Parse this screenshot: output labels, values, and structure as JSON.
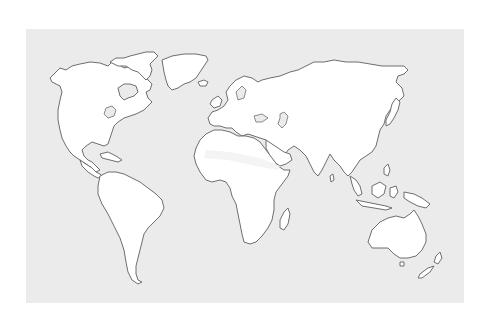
{
  "map": {
    "type": "blank-world-outline",
    "projection": "equirectangular-style",
    "colors": {
      "page_background": "#ffffff",
      "ocean": "#ebebeb",
      "land": "#ffffff",
      "coastline": "#6e6e6e"
    },
    "regions": [
      {
        "name": "North America"
      },
      {
        "name": "Greenland"
      },
      {
        "name": "South America"
      },
      {
        "name": "Europe"
      },
      {
        "name": "Africa"
      },
      {
        "name": "Madagascar"
      },
      {
        "name": "Asia"
      },
      {
        "name": "Japan"
      },
      {
        "name": "Southeast Asia Islands"
      },
      {
        "name": "Australia"
      },
      {
        "name": "New Zealand"
      },
      {
        "name": "Caribbean"
      },
      {
        "name": "Iceland"
      },
      {
        "name": "British Isles"
      }
    ]
  }
}
